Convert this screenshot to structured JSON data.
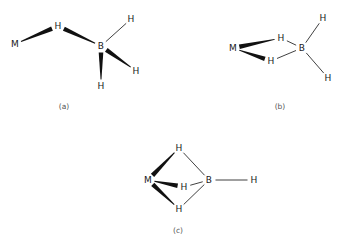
{
  "figure": {
    "background_color": "#ffffff",
    "bond_color": "#2b2b2b",
    "wedge_color": "#111111",
    "label_color": "#1a1a1a",
    "caption_color": "#555555",
    "width": 347,
    "height": 245
  },
  "structures": [
    {
      "id": "a",
      "caption": "(a)",
      "caption_pos": {
        "x": 64,
        "y": 107
      },
      "description": "monodentate single hydrogen bridge",
      "atoms": [
        {
          "id": "a-M",
          "label": "M",
          "x": 15,
          "y": 44
        },
        {
          "id": "a-Hb",
          "label": "H",
          "x": 58,
          "y": 26
        },
        {
          "id": "a-B",
          "label": "B",
          "x": 101,
          "y": 46
        },
        {
          "id": "a-Ht1",
          "label": "H",
          "x": 131,
          "y": 19
        },
        {
          "id": "a-Ht2",
          "label": "H",
          "x": 136,
          "y": 71
        },
        {
          "id": "a-Ht3",
          "label": "H",
          "x": 101,
          "y": 86
        }
      ],
      "bonds": [
        {
          "from": "a-M",
          "to": "a-Hb",
          "style": "wedge",
          "wide_at": "to"
        },
        {
          "from": "a-Hb",
          "to": "a-B",
          "style": "wedge",
          "wide_at": "from"
        },
        {
          "from": "a-B",
          "to": "a-Ht1",
          "style": "thin",
          "wide_at": ""
        },
        {
          "from": "a-B",
          "to": "a-Ht2",
          "style": "wedge",
          "wide_at": "from"
        },
        {
          "from": "a-B",
          "to": "a-Ht3",
          "style": "wedge",
          "wide_at": "from"
        }
      ]
    },
    {
      "id": "b",
      "caption": "(b)",
      "caption_pos": {
        "x": 280,
        "y": 107
      },
      "description": "bidentate double hydrogen bridge",
      "atoms": [
        {
          "id": "b-M",
          "label": "M",
          "x": 233,
          "y": 48
        },
        {
          "id": "b-Hb1",
          "label": "H",
          "x": 281,
          "y": 38
        },
        {
          "id": "b-Hb2",
          "label": "H",
          "x": 271,
          "y": 61
        },
        {
          "id": "b-B",
          "label": "B",
          "x": 302,
          "y": 48
        },
        {
          "id": "b-Ht1",
          "label": "H",
          "x": 323,
          "y": 18
        },
        {
          "id": "b-Ht2",
          "label": "H",
          "x": 328,
          "y": 78
        }
      ],
      "bonds": [
        {
          "from": "b-M",
          "to": "b-Hb1",
          "style": "wedge",
          "wide_at": "from"
        },
        {
          "from": "b-M",
          "to": "b-Hb2",
          "style": "wedge",
          "wide_at": "to"
        },
        {
          "from": "b-Hb1",
          "to": "b-B",
          "style": "thin",
          "wide_at": ""
        },
        {
          "from": "b-Hb2",
          "to": "b-B",
          "style": "thin",
          "wide_at": ""
        },
        {
          "from": "b-B",
          "to": "b-Ht1",
          "style": "thin",
          "wide_at": ""
        },
        {
          "from": "b-B",
          "to": "b-Ht2",
          "style": "thin",
          "wide_at": ""
        }
      ]
    },
    {
      "id": "c",
      "caption": "(c)",
      "caption_pos": {
        "x": 178,
        "y": 231
      },
      "description": "tridentate triple hydrogen bridge",
      "atoms": [
        {
          "id": "c-M",
          "label": "M",
          "x": 148,
          "y": 180
        },
        {
          "id": "c-Hb1",
          "label": "H",
          "x": 179,
          "y": 148
        },
        {
          "id": "c-Hb2",
          "label": "H",
          "x": 184,
          "y": 187
        },
        {
          "id": "c-Hb3",
          "label": "H",
          "x": 179,
          "y": 209
        },
        {
          "id": "c-B",
          "label": "B",
          "x": 209,
          "y": 180
        },
        {
          "id": "c-Ht1",
          "label": "H",
          "x": 254,
          "y": 180
        }
      ],
      "bonds": [
        {
          "from": "c-M",
          "to": "c-Hb1",
          "style": "wedge",
          "wide_at": "from"
        },
        {
          "from": "c-M",
          "to": "c-Hb2",
          "style": "wedge",
          "wide_at": "to"
        },
        {
          "from": "c-M",
          "to": "c-Hb3",
          "style": "wedge",
          "wide_at": "from"
        },
        {
          "from": "c-Hb1",
          "to": "c-B",
          "style": "thin",
          "wide_at": ""
        },
        {
          "from": "c-Hb2",
          "to": "c-B",
          "style": "thin",
          "wide_at": ""
        },
        {
          "from": "c-Hb3",
          "to": "c-B",
          "style": "thin",
          "wide_at": ""
        },
        {
          "from": "c-B",
          "to": "c-Ht1",
          "style": "thin",
          "wide_at": ""
        }
      ]
    }
  ]
}
